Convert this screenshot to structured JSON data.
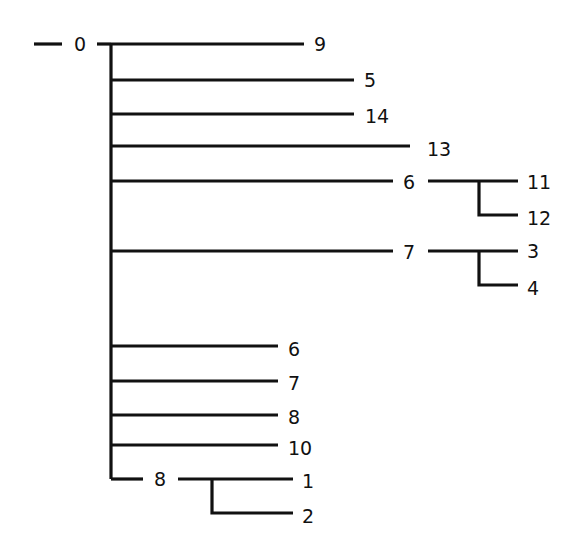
{
  "diagram": {
    "type": "tree",
    "root": {
      "label": "0",
      "x": 80,
      "y": 44
    },
    "edges": [
      {
        "id": "root-stub",
        "points": [
          [
            34,
            44
          ],
          [
            62,
            44
          ]
        ]
      },
      {
        "id": "root-trunk-top",
        "points": [
          [
            97,
            44
          ],
          [
            111,
            44
          ]
        ]
      },
      {
        "id": "trunk",
        "points": [
          [
            111,
            44
          ],
          [
            111,
            479
          ]
        ]
      },
      {
        "id": "to-9",
        "points": [
          [
            111,
            44
          ],
          [
            304,
            44
          ]
        ]
      },
      {
        "id": "to-5",
        "points": [
          [
            111,
            80
          ],
          [
            354,
            80
          ]
        ]
      },
      {
        "id": "to-14",
        "points": [
          [
            111,
            114
          ],
          [
            354,
            114
          ]
        ]
      },
      {
        "id": "to-13",
        "points": [
          [
            111,
            146
          ],
          [
            410,
            146
          ]
        ]
      },
      {
        "id": "to-6a",
        "points": [
          [
            111,
            181
          ],
          [
            393,
            181
          ]
        ]
      },
      {
        "id": "6a-to-11",
        "points": [
          [
            428,
            181
          ],
          [
            518,
            181
          ]
        ]
      },
      {
        "id": "6a-to-12",
        "points": [
          [
            479,
            181
          ],
          [
            479,
            215
          ],
          [
            518,
            215
          ]
        ]
      },
      {
        "id": "to-7a",
        "points": [
          [
            111,
            251
          ],
          [
            393,
            251
          ]
        ]
      },
      {
        "id": "7a-to-3",
        "points": [
          [
            428,
            251
          ],
          [
            518,
            251
          ]
        ]
      },
      {
        "id": "7a-to-4",
        "points": [
          [
            479,
            251
          ],
          [
            479,
            285
          ],
          [
            518,
            285
          ]
        ]
      },
      {
        "id": "to-6b",
        "points": [
          [
            111,
            346
          ],
          [
            278,
            346
          ]
        ]
      },
      {
        "id": "to-7b",
        "points": [
          [
            111,
            381
          ],
          [
            278,
            381
          ]
        ]
      },
      {
        "id": "to-8b",
        "points": [
          [
            111,
            415
          ],
          [
            278,
            415
          ]
        ]
      },
      {
        "id": "to-10",
        "points": [
          [
            111,
            445
          ],
          [
            278,
            445
          ]
        ]
      },
      {
        "id": "to-8c",
        "points": [
          [
            111,
            479
          ],
          [
            143,
            479
          ]
        ]
      },
      {
        "id": "8c-to-1",
        "points": [
          [
            178,
            479
          ],
          [
            293,
            479
          ]
        ]
      },
      {
        "id": "8c-to-2",
        "points": [
          [
            212,
            479
          ],
          [
            212,
            513
          ],
          [
            293,
            513
          ]
        ]
      }
    ],
    "nodes": [
      {
        "id": "n0",
        "label": "0",
        "x": 80,
        "y": 44,
        "anchor": "middle"
      },
      {
        "id": "n9",
        "label": "9",
        "x": 314,
        "y": 44,
        "anchor": "start"
      },
      {
        "id": "n5",
        "label": "5",
        "x": 364,
        "y": 80,
        "anchor": "start"
      },
      {
        "id": "n14",
        "label": "14",
        "x": 365,
        "y": 116,
        "anchor": "start"
      },
      {
        "id": "n13",
        "label": "13",
        "x": 427,
        "y": 149,
        "anchor": "start"
      },
      {
        "id": "n6a",
        "label": "6",
        "x": 409,
        "y": 182,
        "anchor": "middle"
      },
      {
        "id": "n11",
        "label": "11",
        "x": 527,
        "y": 182,
        "anchor": "start"
      },
      {
        "id": "n12",
        "label": "12",
        "x": 527,
        "y": 218,
        "anchor": "start"
      },
      {
        "id": "n7a",
        "label": "7",
        "x": 409,
        "y": 252,
        "anchor": "middle"
      },
      {
        "id": "n3",
        "label": "3",
        "x": 527,
        "y": 251,
        "anchor": "start"
      },
      {
        "id": "n4",
        "label": "4",
        "x": 527,
        "y": 288,
        "anchor": "start"
      },
      {
        "id": "n6b",
        "label": "6",
        "x": 288,
        "y": 349,
        "anchor": "start"
      },
      {
        "id": "n7b",
        "label": "7",
        "x": 288,
        "y": 383,
        "anchor": "start"
      },
      {
        "id": "n8b",
        "label": "8",
        "x": 288,
        "y": 417,
        "anchor": "start"
      },
      {
        "id": "n10",
        "label": "10",
        "x": 288,
        "y": 448,
        "anchor": "start"
      },
      {
        "id": "n8c",
        "label": "8",
        "x": 160,
        "y": 479,
        "anchor": "middle"
      },
      {
        "id": "n1",
        "label": "1",
        "x": 302,
        "y": 481,
        "anchor": "start"
      },
      {
        "id": "n2",
        "label": "2",
        "x": 302,
        "y": 516,
        "anchor": "start"
      }
    ]
  }
}
